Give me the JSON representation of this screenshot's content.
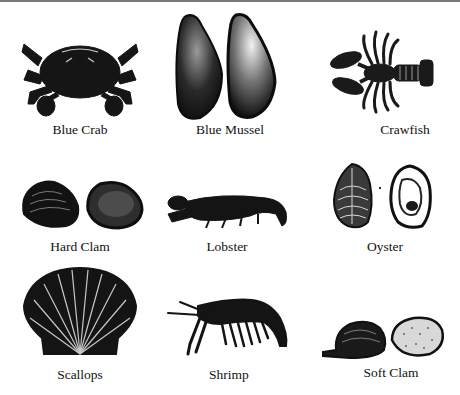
{
  "figure": {
    "items": [
      {
        "name": "Blue Crab",
        "icon": "blue-crab-illustration"
      },
      {
        "name": "Blue Mussel",
        "icon": "blue-mussel-illustration"
      },
      {
        "name": "Crawfish",
        "icon": "crawfish-illustration"
      },
      {
        "name": "Hard Clam",
        "icon": "hard-clam-illustration"
      },
      {
        "name": "Lobster",
        "icon": "lobster-illustration"
      },
      {
        "name": "Oyster",
        "icon": "oyster-illustration"
      },
      {
        "name": "Scallops",
        "icon": "scallop-illustration"
      },
      {
        "name": "Shrimp",
        "icon": "shrimp-illustration"
      },
      {
        "name": "Soft Clam",
        "icon": "soft-clam-illustration"
      }
    ]
  },
  "colors": {
    "ink": "#111111",
    "background": "#ffffff",
    "top_rule": "#7a7a7a"
  }
}
